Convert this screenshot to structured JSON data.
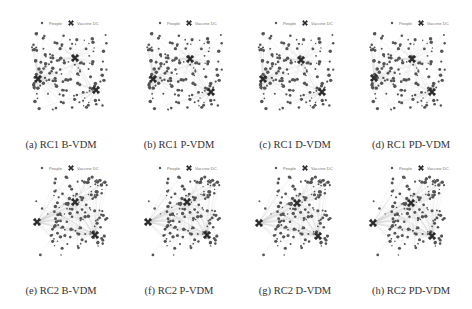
{
  "figure": {
    "legend": {
      "people_label": "People",
      "dc_label": "Vaccine DC"
    },
    "panels": [
      {
        "id": "a",
        "caption": "(a) RC1 B-VDM",
        "row": 0,
        "col": 0,
        "seed": 11,
        "dcs": [
          [
            73,
            58
          ],
          [
            36,
            79
          ],
          [
            94,
            90
          ]
        ],
        "layout": "uniform",
        "edges": "light"
      },
      {
        "id": "b",
        "caption": "(b) RC1 P-VDM",
        "row": 0,
        "col": 1,
        "seed": 11,
        "dcs": [
          [
            70,
            59
          ],
          [
            33,
            79
          ],
          [
            91,
            92
          ]
        ],
        "layout": "uniform",
        "edges": "light"
      },
      {
        "id": "c",
        "caption": "(c) RC1 D-VDM",
        "row": 0,
        "col": 2,
        "seed": 11,
        "dcs": [
          [
            65,
            60
          ],
          [
            27,
            79
          ],
          [
            86,
            92
          ]
        ],
        "layout": "uniform",
        "edges": "light"
      },
      {
        "id": "d",
        "caption": "(d) RC1 PD-VDM",
        "row": 0,
        "col": 3,
        "seed": 11,
        "dcs": [
          [
            60,
            59
          ],
          [
            22,
            78
          ],
          [
            80,
            92
          ]
        ],
        "layout": "uniform",
        "edges": "light"
      },
      {
        "id": "e",
        "caption": "(e) RC2 B-VDM",
        "row": 1,
        "col": 0,
        "seed": 23,
        "dcs": [
          [
            73,
            47
          ],
          [
            35,
            67
          ],
          [
            93,
            80
          ]
        ],
        "layout": "clustered",
        "edges": "fan"
      },
      {
        "id": "f",
        "caption": "(f) RC2 P-VDM",
        "row": 1,
        "col": 1,
        "seed": 23,
        "dcs": [
          [
            67,
            47
          ],
          [
            28,
            67
          ],
          [
            87,
            80
          ]
        ],
        "layout": "clustered",
        "edges": "fan"
      },
      {
        "id": "g",
        "caption": "(g) RC2 D-VDM",
        "row": 1,
        "col": 2,
        "seed": 23,
        "dcs": [
          [
            61,
            48
          ],
          [
            23,
            68
          ],
          [
            82,
            81
          ]
        ],
        "layout": "clustered",
        "edges": "fan"
      },
      {
        "id": "h",
        "caption": "(h) RC2 PD-VDM",
        "row": 1,
        "col": 3,
        "seed": 23,
        "dcs": [
          [
            59,
            48
          ],
          [
            21,
            68
          ],
          [
            80,
            81
          ]
        ],
        "layout": "clustered",
        "edges": "fan"
      }
    ]
  },
  "colors": {
    "dot": "#555555",
    "dc": "#2b2b2b",
    "edge": "#cfcfcf",
    "caption": "#333333"
  }
}
